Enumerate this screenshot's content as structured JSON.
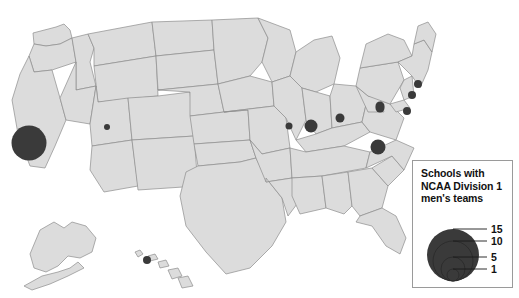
{
  "page": {
    "background_color": "#ffffff",
    "width": 519,
    "height": 298
  },
  "map": {
    "name": "united-states-map",
    "land_fill": "#dcdcdc",
    "land_stroke": "#8c8c8c",
    "outer_stroke": "#6f6f6f",
    "marker_fill": "#3a3a3a",
    "insets": [
      "alaska",
      "hawaii"
    ]
  },
  "legend": {
    "title_lines": [
      "Schools with",
      "NCAA Division 1",
      "men's teams"
    ],
    "title_full": "Schools with NCAA Division 1 men's teams",
    "border_color": "#9a9a9a",
    "background_color": "#ffffff",
    "circle_fill": "#3a3a3a",
    "entries": [
      {
        "label": "15",
        "value": 15,
        "radius": 26
      },
      {
        "label": "10",
        "value": 10,
        "radius": 20
      },
      {
        "label": "5",
        "value": 5,
        "radius": 12
      },
      {
        "label": "1",
        "value": 1,
        "radius": 6
      }
    ]
  },
  "chart_data": {
    "type": "map",
    "title": "Schools with NCAA Division 1 men's teams",
    "legend_position": "bottom-right",
    "legend_breaks": [
      15,
      10,
      5,
      1
    ],
    "value_field": "schools",
    "markers": [
      {
        "name": "california",
        "label": "California",
        "schools": 15,
        "radius": 17.5,
        "x": 29,
        "y": 143
      },
      {
        "name": "colorado",
        "label": "Colorado",
        "schools": 1,
        "radius": 3,
        "x": 107,
        "y": 127
      },
      {
        "name": "missouri",
        "label": "Missouri",
        "schools": 2,
        "radius": 3.5,
        "x": 289,
        "y": 126
      },
      {
        "name": "illinois",
        "label": "Illinois",
        "schools": 6,
        "radius": 6.5,
        "x": 311,
        "y": 126
      },
      {
        "name": "indiana",
        "label": "Indiana",
        "schools": 3,
        "radius": 4.5,
        "x": 340,
        "y": 118
      },
      {
        "name": "ohio",
        "label": "Ohio",
        "schools": 3,
        "radius": 4.5,
        "x": 380,
        "y": 106
      },
      {
        "name": "virginia",
        "label": "Virginia",
        "schools": 7,
        "radius": 7.5,
        "x": 378,
        "y": 147
      },
      {
        "name": "pennsylvania",
        "label": "Pennsylvania",
        "schools": 3,
        "radius": 4.5,
        "x": 380,
        "y": 108
      },
      {
        "name": "new-jersey",
        "label": "New Jersey",
        "schools": 3,
        "radius": 4,
        "x": 407,
        "y": 111
      },
      {
        "name": "connecticut",
        "label": "Connecticut",
        "schools": 3,
        "radius": 4,
        "x": 412,
        "y": 95
      },
      {
        "name": "massachusetts",
        "label": "Massachusetts",
        "schools": 3,
        "radius": 4,
        "x": 418,
        "y": 84
      },
      {
        "name": "hawaii",
        "label": "Hawaii",
        "schools": 2,
        "radius": 4,
        "x": 147,
        "y": 260
      }
    ]
  }
}
